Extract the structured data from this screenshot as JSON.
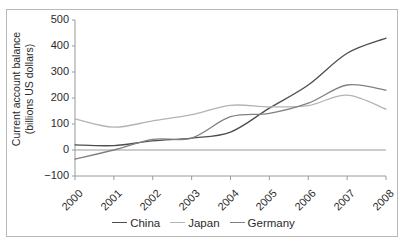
{
  "chart_data": {
    "type": "line",
    "title": "",
    "xlabel": "",
    "ylabel": "Current account balance\n(billions US dollars)",
    "x": [
      2000,
      2001,
      2002,
      2003,
      2004,
      2005,
      2006,
      2007,
      2008
    ],
    "categories": [
      "2000",
      "2001",
      "2002",
      "2003",
      "2004",
      "2005",
      "2006",
      "2007",
      "2008"
    ],
    "series": [
      {
        "name": "China",
        "color": "#4d4d4d",
        "values": [
          20,
          17,
          35,
          46,
          69,
          161,
          250,
          372,
          430
        ]
      },
      {
        "name": "Japan",
        "color": "#b3b3b3",
        "values": [
          120,
          88,
          112,
          136,
          172,
          166,
          171,
          211,
          157
        ]
      },
      {
        "name": "Germany",
        "color": "#808080",
        "values": [
          -35,
          0,
          41,
          46,
          128,
          141,
          180,
          250,
          230
        ]
      }
    ],
    "ylim": [
      -100,
      500
    ],
    "yticks": [
      -100,
      0,
      100,
      200,
      300,
      400,
      500
    ],
    "ytick_labels": [
      "−100",
      "0",
      "100",
      "200",
      "300",
      "400",
      "500"
    ],
    "xlim": [
      2000,
      2008
    ],
    "grid": false,
    "legend_position": "bottom",
    "smoothing": "spline",
    "axis_color": "#9a9a9a",
    "text_color": "#2b2b2b",
    "frame_color": "#b9b9b9",
    "zero_line": 0,
    "legend_entries": [
      {
        "label": "China",
        "color": "#4d4d4d"
      },
      {
        "label": "Japan",
        "color": "#b3b3b3"
      },
      {
        "label": "Germany",
        "color": "#808080"
      }
    ]
  }
}
